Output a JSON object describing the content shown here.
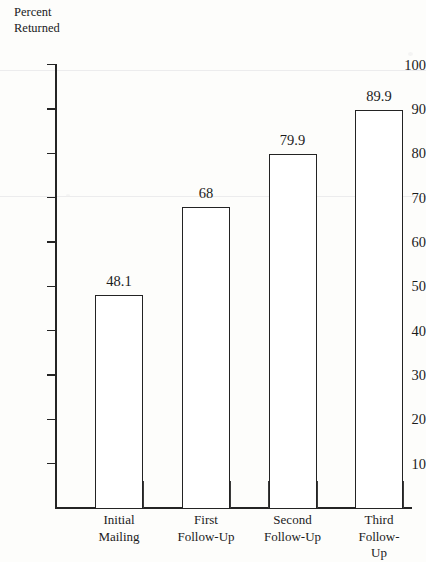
{
  "chart_data": {
    "type": "bar",
    "title": "",
    "xlabel": "",
    "ylabel": "Percent Returned",
    "ylabel_lines": [
      "Percent",
      "Returned"
    ],
    "categories": [
      "Initial Mailing",
      "First Follow-Up",
      "Second Follow-Up",
      "Third Follow-Up"
    ],
    "category_lines": [
      [
        "Initial",
        "Mailing"
      ],
      [
        "First",
        "Follow-Up"
      ],
      [
        "Second",
        "Follow-Up"
      ],
      [
        "Third",
        "Follow-Up"
      ]
    ],
    "values": [
      48.1,
      68,
      79.9,
      89.9
    ],
    "value_labels": [
      "48.1",
      "68",
      "79.9",
      "89.9"
    ],
    "ylim": [
      0,
      100
    ],
    "yticks": [
      10,
      20,
      30,
      40,
      50,
      60,
      70,
      80,
      90,
      100
    ],
    "ytick_labels": [
      "10",
      "20",
      "30",
      "40",
      "50",
      "60",
      "70",
      "80",
      "90",
      "100"
    ],
    "grid": false,
    "legend": null,
    "bar_style": {
      "fill": "#ffffff",
      "stroke": "#232323"
    },
    "axis_color": "#242424",
    "background": "#fdfdfb"
  }
}
